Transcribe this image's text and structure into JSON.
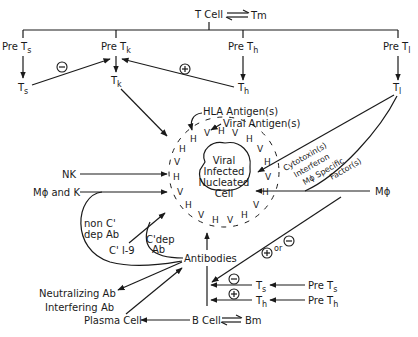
{
  "diagram": {
    "top": {
      "tcell": "T Cell",
      "tm": "Tm",
      "pre_ts": "Pre T",
      "pre_ts_sub": "s",
      "pre_tk": "Pre T",
      "pre_tk_sub": "k",
      "pre_th": "Pre T",
      "pre_th_sub": "h",
      "pre_tl": "Pre T",
      "pre_tl_sub": "l",
      "ts": "T",
      "ts_sub": "s",
      "tk": "T",
      "tk_sub": "k",
      "th": "T",
      "th_sub": "h",
      "tl": "T",
      "tl_sub": "l",
      "minus": "−",
      "plus": "+"
    },
    "center": {
      "line1": "Viral",
      "line2": "Infected",
      "line3": "Nucleated",
      "line4": "Cell",
      "hla": "HLA Antigen(s)",
      "viral": "Viral Antigen(s)",
      "h": "H",
      "v": "V"
    },
    "right": {
      "cytotoxin": "Cytotoxin(s)",
      "interferon": "Interferon",
      "mphi_specific": "Mϕ Specific",
      "factors": "Factor(s)",
      "mphi": "Mϕ",
      "plus_or_minus": "or"
    },
    "left": {
      "nk": "NK",
      "mphi_k": "Mϕ and K",
      "non_c_dep_1": "non C'",
      "non_c_dep_2": "dep Ab",
      "c19": "C' l-9",
      "c_dep_1": "C'dep",
      "c_dep_2": "Ab"
    },
    "bottom": {
      "antibodies": "Antibodies",
      "neutralizing": "Neutralizing Ab",
      "interfering": "Interfering Ab",
      "plasma": "Plasma Cell",
      "bcell": "B Cell",
      "bm": "Bm",
      "ts": "T",
      "ts_sub": "s",
      "th": "T",
      "th_sub": "h",
      "pre_ts": "Pre T",
      "pre_ts_sub": "s",
      "pre_th": "Pre T",
      "pre_th_sub": "h"
    }
  }
}
